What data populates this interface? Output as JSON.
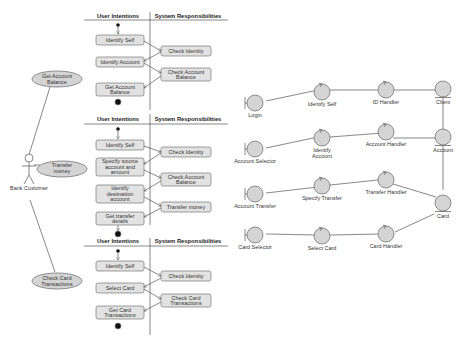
{
  "use_case": {
    "actor": "Bank Customer",
    "cases": [
      {
        "label1": "Get Account",
        "label2": "Balance"
      },
      {
        "label1": "Transfer",
        "label2": "money"
      },
      {
        "label1": "Check Card",
        "label2": "Transactions"
      }
    ]
  },
  "swimlanes": {
    "header_left": "User Intentions",
    "header_right": "System Responsibilities",
    "diagrams": [
      {
        "user": [
          [
            "Identify Self"
          ],
          [
            "Identify Account"
          ],
          [
            "Get Account",
            "Balance"
          ]
        ],
        "system": [
          [
            "Check Identity"
          ],
          [
            "Check Account",
            "Balance"
          ]
        ]
      },
      {
        "user": [
          [
            "Identify Self"
          ],
          [
            "Specify source",
            "account and",
            "amount"
          ],
          [
            "Identify",
            "destination",
            "account"
          ],
          [
            "Get transfer",
            "details"
          ]
        ],
        "system": [
          [
            "Check Identity"
          ],
          [
            "Check Account",
            "Balance"
          ],
          [
            "Transfer money"
          ]
        ]
      },
      {
        "user": [
          [
            "Identify Self"
          ],
          [
            "Select Card"
          ],
          [
            "Get Card",
            "Transactions"
          ]
        ],
        "system": [
          [
            "Check Identity"
          ],
          [
            "Check Card",
            "Transactions"
          ]
        ]
      }
    ]
  },
  "robustness": {
    "boundaries": [
      "Login",
      "Account Selector",
      "Account Transfer",
      "Card Selector"
    ],
    "controls": [
      "Identify Self",
      "Identify Account",
      "Specify Transfer",
      "Select Card",
      "ID Handler",
      "Account Handler",
      "Transfer Handler",
      "Card Handler"
    ],
    "entities": [
      "Client",
      "Account",
      "Card"
    ]
  }
}
